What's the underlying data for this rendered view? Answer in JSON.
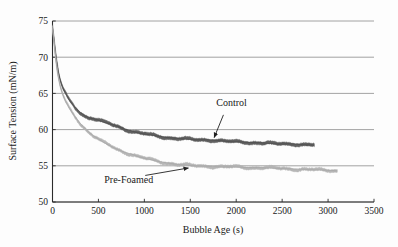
{
  "chart_data": {
    "type": "line",
    "title": "",
    "xlabel": "Bubble Age (s)",
    "ylabel": "Surface Tension (mN/m)",
    "xlim": [
      0,
      3500
    ],
    "ylim": [
      50,
      75
    ],
    "xticks": [
      0,
      500,
      1000,
      1500,
      2000,
      2500,
      3000,
      3500
    ],
    "yticks": [
      50,
      55,
      60,
      65,
      70,
      75
    ],
    "grid": "horizontal",
    "legend_position": "inline-annotations",
    "annotations": [
      {
        "name": "control-annotation",
        "text": "Control",
        "text_x": 1950,
        "text_y": 63.3,
        "arrow_to_x": 1760,
        "arrow_to_y": 58.9
      },
      {
        "name": "pre-foamed-annotation",
        "text": "Pre-Foamed",
        "text_x": 830,
        "text_y": 52.6,
        "arrow_to_x": 1480,
        "arrow_to_y": 54.7
      }
    ],
    "series": [
      {
        "name": "Control",
        "color": "#4d4d4d",
        "band_color": "#595959",
        "band_width_mN": 0.42,
        "x_end": 2850,
        "x": [
          0,
          15,
          30,
          45,
          60,
          80,
          100,
          125,
          150,
          180,
          210,
          250,
          300,
          350,
          400,
          450,
          500,
          560,
          620,
          700,
          780,
          860,
          950,
          1050,
          1150,
          1250,
          1350,
          1450,
          1550,
          1650,
          1750,
          1850,
          1950,
          2050,
          2150,
          2250,
          2350,
          2450,
          2550,
          2650,
          2750,
          2850
        ],
        "y": [
          74.1,
          72.6,
          70.9,
          69.4,
          68.2,
          67.0,
          66.2,
          65.4,
          64.8,
          64.1,
          63.6,
          63.0,
          62.4,
          61.9,
          61.6,
          61.5,
          61.3,
          61.0,
          60.8,
          60.5,
          60.1,
          59.8,
          59.5,
          59.3,
          59.1,
          58.9,
          58.8,
          58.7,
          58.6,
          58.6,
          58.55,
          58.45,
          58.3,
          58.3,
          58.2,
          58.2,
          58.1,
          58.0,
          58.05,
          58.0,
          57.9,
          57.85
        ]
      },
      {
        "name": "Pre-Foamed",
        "color": "#a6a6a6",
        "band_color": "#b3b3b3",
        "band_width_mN": 0.38,
        "x_end": 3100,
        "x": [
          0,
          15,
          30,
          45,
          60,
          80,
          100,
          125,
          150,
          180,
          210,
          250,
          300,
          350,
          400,
          450,
          500,
          560,
          620,
          700,
          780,
          860,
          950,
          1050,
          1150,
          1250,
          1350,
          1450,
          1550,
          1650,
          1750,
          1850,
          1950,
          2050,
          2150,
          2250,
          2350,
          2450,
          2550,
          2650,
          2750,
          2850,
          2950,
          3050,
          3100
        ],
        "y": [
          74.0,
          72.3,
          70.4,
          68.8,
          67.5,
          66.2,
          65.3,
          64.4,
          63.7,
          63.0,
          62.4,
          61.7,
          60.9,
          60.2,
          59.6,
          59.1,
          58.7,
          58.2,
          57.8,
          57.3,
          56.9,
          56.6,
          56.2,
          55.9,
          55.6,
          55.4,
          55.2,
          55.1,
          55.0,
          54.95,
          54.9,
          54.85,
          54.85,
          54.8,
          54.75,
          54.75,
          54.7,
          54.65,
          54.6,
          54.55,
          54.5,
          54.45,
          54.4,
          54.35,
          54.3
        ]
      }
    ]
  },
  "axes": {
    "x_tick_labels": [
      "0",
      "500",
      "1000",
      "1500",
      "2000",
      "2500",
      "3000",
      "3500"
    ],
    "y_tick_labels": [
      "50",
      "55",
      "60",
      "65",
      "70",
      "75"
    ],
    "x_title": "Bubble Age (s)",
    "y_title": "Surface Tension (mN/m)"
  },
  "colors": {
    "background": "#fdfdfd",
    "axis": "#2b2b2b",
    "grid": "#8c8c8c",
    "control": "#4d4d4d",
    "pre_foamed": "#a6a6a6",
    "text": "#202020"
  }
}
